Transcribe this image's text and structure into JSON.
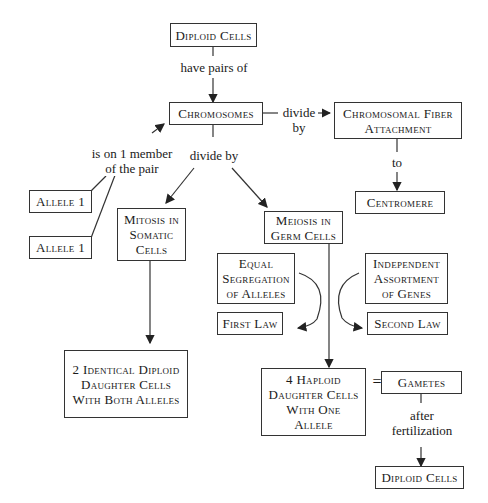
{
  "nodes": {
    "diploid_top": "Diploid Cells",
    "chromosomes": "Chromosomes",
    "fiber": "Chromosomal Fiber Attachment",
    "centromere": "Centromere",
    "allele1_a": "Allele 1",
    "allele1_b": "Allele 1",
    "mitosis": "Mitosis in Somatic Cells",
    "meiosis": "Meiosis in Germ Cells",
    "equal_seg": "Equal Segregation of Alleles",
    "indep": "Independent Assortment of Genes",
    "first_law": "First Law",
    "second_law": "Second Law",
    "two_identical": "2 Identical Diploid Daughter Cells With Both Alleles",
    "four_haploid": "4 Haploid Daughter Cells With One Allele",
    "gametes": "Gametes",
    "diploid_bottom": "Diploid Cells"
  },
  "edges": {
    "have_pairs": "have pairs of",
    "divide_by_fiber": "divide by",
    "to": "to",
    "is_on": "is on 1 member of the pair",
    "divide_by": "divide by",
    "equals": "=",
    "after_fert": "after fertilization"
  }
}
